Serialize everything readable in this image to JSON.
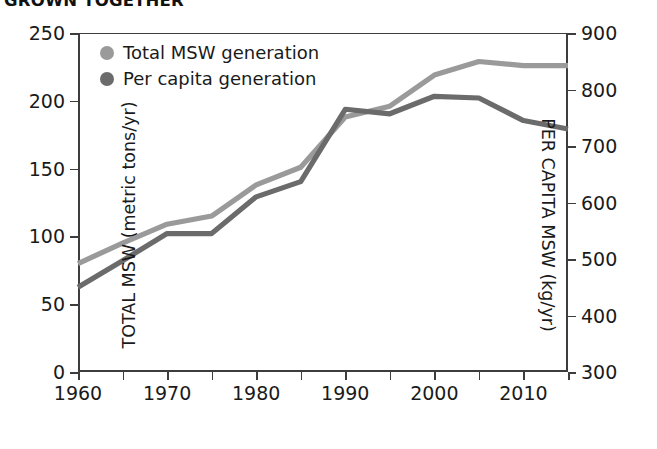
{
  "title": "GROWN TOGETHER",
  "legend": {
    "position": "top-left",
    "items": [
      {
        "label": "Total MSW generation",
        "color": "#9a9a9a",
        "name": "legend-total-msw"
      },
      {
        "label": "Per capita generation",
        "color": "#6b6b6b",
        "name": "legend-per-capita"
      }
    ]
  },
  "axes": {
    "left": {
      "title": "TOTAL MSW (metric tons/yr)",
      "ticks": [
        "0",
        "50",
        "100",
        "150",
        "200",
        "250"
      ],
      "min": 0,
      "max": 250
    },
    "right": {
      "title": "PER CAPITA MSW (kg/yr)",
      "ticks": [
        "300",
        "400",
        "500",
        "600",
        "700",
        "800",
        "900"
      ],
      "min": 300,
      "max": 900
    },
    "bottom": {
      "title": "",
      "ticks": [
        "1960",
        "1970",
        "1980",
        "1990",
        "2000",
        "2010"
      ],
      "min": 1960,
      "max": 2015
    }
  },
  "chart_data": {
    "type": "line",
    "title": "GROWN TOGETHER",
    "xlabel": "",
    "ylabel": "TOTAL MSW (metric tons/yr)",
    "y2label": "PER CAPITA MSW (kg/yr)",
    "xlim": [
      1960,
      2015
    ],
    "ylim": [
      0,
      250
    ],
    "y2lim": [
      300,
      900
    ],
    "grid": false,
    "legend_position": "top-left",
    "x": [
      1960,
      1965,
      1970,
      1975,
      1980,
      1985,
      1990,
      1995,
      2000,
      2005,
      2010,
      2015
    ],
    "series": [
      {
        "name": "Total MSW generation",
        "axis": "left",
        "units": "metric tons/yr",
        "color": "#9a9a9a",
        "values": [
          80,
          95,
          109,
          115,
          138,
          151,
          188,
          196,
          219,
          229,
          226,
          226
        ]
      },
      {
        "name": "Per capita generation",
        "axis": "right",
        "units": "kg/yr",
        "color": "#6b6b6b",
        "values": [
          450,
          497,
          545,
          545,
          610,
          637,
          765,
          757,
          788,
          785,
          745,
          730
        ]
      }
    ]
  }
}
